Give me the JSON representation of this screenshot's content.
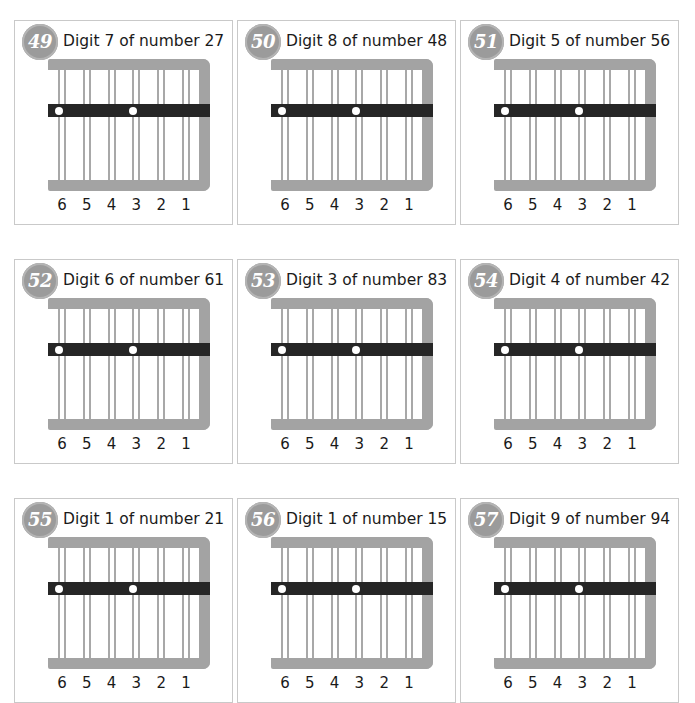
{
  "worksheet": {
    "kind": "abacus-digit-exercise",
    "background_color": "#ffffff",
    "panel_border_color": "#c9c9c9",
    "badge_color": "#9b9b9b",
    "frame_color": "#a3a3a3",
    "rod_color": "#a8a8a8",
    "slider_color": "#262626",
    "bead_color": "#ffffff",
    "text_color": "#1a1a1a"
  },
  "abacus": {
    "column_labels": [
      "6",
      "5",
      "4",
      "3",
      "2",
      "1"
    ],
    "rods_per_column": 2,
    "total_rods": 12,
    "bead_columns": [
      6,
      3
    ]
  },
  "rows": [
    {
      "panels": [
        {
          "number": "49",
          "title": "Digit 7 of number 27",
          "digit": "7",
          "number_value": "27"
        },
        {
          "number": "50",
          "title": "Digit 8 of number 48",
          "digit": "8",
          "number_value": "48"
        },
        {
          "number": "51",
          "title": "Digit 5 of number 56",
          "digit": "5",
          "number_value": "56"
        }
      ]
    },
    {
      "panels": [
        {
          "number": "52",
          "title": "Digit 6 of number 61",
          "digit": "6",
          "number_value": "61"
        },
        {
          "number": "53",
          "title": "Digit 3 of number 83",
          "digit": "3",
          "number_value": "83"
        },
        {
          "number": "54",
          "title": "Digit 4 of number 42",
          "digit": "4",
          "number_value": "42"
        }
      ]
    },
    {
      "panels": [
        {
          "number": "55",
          "title": "Digit 1 of number 21",
          "digit": "1",
          "number_value": "21"
        },
        {
          "number": "56",
          "title": "Digit 1 of number 15",
          "digit": "1",
          "number_value": "15"
        },
        {
          "number": "57",
          "title": "Digit 9 of number 94",
          "digit": "9",
          "number_value": "94"
        }
      ]
    }
  ]
}
